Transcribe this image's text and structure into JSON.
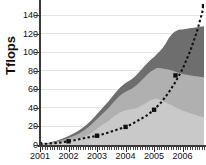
{
  "chart_data": {
    "type": "area",
    "title": "",
    "subtitle": "",
    "xlabel": "",
    "ylabel": "Tflops",
    "xlim": [
      2001.0,
      2006.75
    ],
    "ylim": [
      0,
      152
    ],
    "grid": true,
    "grid_axis": "y",
    "legend": false,
    "legend_position": "none",
    "yticks": [
      0,
      20,
      40,
      60,
      80,
      100,
      120,
      140
    ],
    "ytick_labels": [
      "0",
      "20",
      "40",
      "60",
      "80",
      "100",
      "120",
      "140"
    ],
    "xticks": [
      2001,
      2002,
      2003,
      2004,
      2005,
      2006
    ],
    "xtick_labels": [
      "2001",
      "2002",
      "2003",
      "2004",
      "2005",
      "2006"
    ],
    "xtick_minor_count": 69,
    "colors": {
      "band_bottom": "#c9c9c9",
      "band_middle": "#b0b0b0",
      "band_top": "#6e6e6e",
      "trend_line": "#111111",
      "marker": "#111111",
      "axis": "#3a3a3a",
      "grid": "#e4e4e4",
      "background": "#ffffff",
      "text": "#111111"
    },
    "x": [
      2001.0,
      2001.1,
      2001.2,
      2001.3,
      2001.4,
      2001.5,
      2001.6,
      2001.7,
      2001.8,
      2001.9,
      2002.0,
      2002.1,
      2002.2,
      2002.3,
      2002.4,
      2002.5,
      2002.6,
      2002.7,
      2002.8,
      2002.9,
      2003.0,
      2003.1,
      2003.2,
      2003.3,
      2003.4,
      2003.5,
      2003.6,
      2003.7,
      2003.8,
      2003.9,
      2004.0,
      2004.1,
      2004.2,
      2004.3,
      2004.4,
      2004.5,
      2004.6,
      2004.7,
      2004.8,
      2004.9,
      2005.0,
      2005.1,
      2005.2,
      2005.3,
      2005.4,
      2005.5,
      2005.6,
      2005.7,
      2005.8,
      2005.9,
      2006.0,
      2006.1,
      2006.2,
      2006.3,
      2006.4,
      2006.5,
      2006.6,
      2006.75
    ],
    "series": [
      {
        "name": "band-bottom",
        "stack_order": 1,
        "color": "#c9c9c9",
        "values": [
          0.4,
          0.6,
          0.8,
          1.1,
          1.4,
          1.8,
          2.2,
          2.6,
          3.0,
          3.6,
          4.2,
          4.8,
          5.4,
          6.2,
          7.0,
          8.0,
          9.5,
          11.0,
          13.0,
          15.0,
          17.5,
          20.0,
          22.0,
          24.0,
          26.0,
          28.5,
          31.0,
          33.0,
          35.0,
          36.5,
          37.5,
          38.0,
          38.5,
          39.0,
          40.0,
          41.5,
          43.0,
          45.0,
          47.0,
          48.5,
          49.5,
          50.0,
          49.0,
          47.5,
          46.0,
          44.5,
          43.0,
          41.5,
          40.0,
          38.5,
          37.0,
          36.0,
          35.0,
          34.0,
          33.0,
          32.0,
          31.0,
          30.0
        ]
      },
      {
        "name": "band-middle",
        "stack_order": 2,
        "color": "#b0b0b0",
        "values": [
          0.3,
          0.4,
          0.6,
          0.8,
          1.0,
          1.3,
          1.6,
          2.0,
          2.4,
          2.9,
          3.4,
          4.0,
          4.6,
          5.2,
          6.0,
          6.8,
          7.6,
          8.4,
          9.2,
          10.0,
          10.5,
          11.0,
          12.0,
          13.0,
          14.0,
          15.0,
          16.0,
          17.0,
          18.0,
          19.0,
          20.0,
          21.0,
          22.0,
          23.5,
          25.0,
          26.5,
          28.0,
          29.0,
          30.0,
          31.0,
          32.0,
          33.0,
          34.0,
          35.0,
          36.0,
          37.0,
          37.5,
          38.0,
          38.5,
          39.0,
          39.5,
          40.0,
          40.5,
          41.0,
          41.5,
          42.0,
          42.5,
          43.0
        ]
      },
      {
        "name": "band-top",
        "stack_order": 3,
        "color": "#6e6e6e",
        "values": [
          0.2,
          0.3,
          0.4,
          0.5,
          0.7,
          0.9,
          1.1,
          1.3,
          1.6,
          1.9,
          2.2,
          2.5,
          2.8,
          3.1,
          3.4,
          3.7,
          4.0,
          4.3,
          4.6,
          5.0,
          5.4,
          5.8,
          6.2,
          6.6,
          7.0,
          7.4,
          7.8,
          8.2,
          8.6,
          9.0,
          9.4,
          9.8,
          10.2,
          10.6,
          11.0,
          11.4,
          11.8,
          12.2,
          12.6,
          13.0,
          13.5,
          15.0,
          18.0,
          22.0,
          27.0,
          33.0,
          38.0,
          42.0,
          45.0,
          47.0,
          48.0,
          49.0,
          50.0,
          51.0,
          52.0,
          53.0,
          54.0,
          55.0
        ]
      }
    ],
    "trend": {
      "name": "exponential-trend",
      "style": "dotted",
      "color": "#111111",
      "x": [
        2001.0,
        2001.25,
        2001.5,
        2001.75,
        2002.0,
        2002.25,
        2002.5,
        2002.75,
        2003.0,
        2003.25,
        2003.5,
        2003.75,
        2004.0,
        2004.25,
        2004.5,
        2004.75,
        2005.0,
        2005.25,
        2005.5,
        2005.75,
        2006.0,
        2006.25,
        2006.5,
        2006.75
      ],
      "y": [
        1.0,
        1.4,
        2.0,
        2.8,
        4.0,
        5.3,
        7.0,
        8.5,
        10.0,
        12.0,
        14.5,
        17.0,
        19.5,
        23.0,
        27.5,
        32.0,
        38.0,
        46.0,
        56.0,
        68.0,
        82.0,
        100.0,
        122.0,
        150.0
      ],
      "markers": {
        "shape": "square",
        "x": [
          2001.0,
          2002.0,
          2003.0,
          2004.0,
          2005.0,
          2005.75,
          2006.75
        ],
        "y": [
          1.0,
          4.0,
          10.0,
          19.5,
          38.0,
          75.0,
          150.0
        ]
      }
    }
  }
}
